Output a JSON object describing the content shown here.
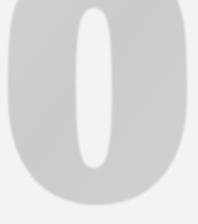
{
  "image": {
    "kind": "scanned-numeral",
    "subject_label": "0",
    "description": "Large light gray numeral zero on a white background, cropped at top and bottom edges",
    "width_px": 198,
    "height_px": 224
  },
  "colors": {
    "background": "#ffffff",
    "glyph_fill": "#d5d6d4",
    "glyph_fill_light": "#dcdddb",
    "glyph_edge": "#e4e5e3",
    "counter_fill": "#ffffff",
    "grain": "#c9cac8"
  },
  "glyph": {
    "character": "0",
    "outer": {
      "left_x": 8,
      "right_x": 187,
      "top_y": -16,
      "bottom_y": 205,
      "center_x": 97,
      "center_y": 95
    },
    "counter": {
      "left_x": 76,
      "right_x": 112,
      "top_y": 8,
      "bottom_y": 168,
      "center_x": 94,
      "center_y": 88
    }
  },
  "grain_texture": {
    "enabled": true,
    "base_frequency": 0.82,
    "octaves": 4,
    "opacity": 0.55
  }
}
